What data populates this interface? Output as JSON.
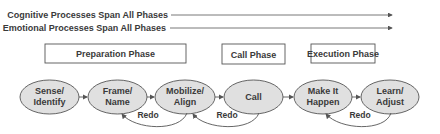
{
  "processes": [
    {
      "label": "Cognitive Processes Span All Phases"
    },
    {
      "label": "Emotional Processes Span All Phases"
    }
  ],
  "phases": [
    {
      "label": "Preparation Phase"
    },
    {
      "label": "Call Phase"
    },
    {
      "label": "Execution Phase"
    }
  ],
  "steps": [
    {
      "line1": "Sense/",
      "line2": "Identify"
    },
    {
      "line1": "Frame/",
      "line2": "Name"
    },
    {
      "line1": "Mobilize/",
      "line2": "Align"
    },
    {
      "line1": "Call",
      "line2": ""
    },
    {
      "line1": "Make It",
      "line2": "Happen"
    },
    {
      "line1": "Learn/",
      "line2": "Adjust"
    }
  ],
  "loops": [
    {
      "label": "Redo"
    },
    {
      "label": "Redo"
    },
    {
      "label": "Redo"
    }
  ],
  "colors": {
    "ellipse_fill": "#e0e0e0",
    "stroke": "#555555",
    "text": "#3a3a3a"
  }
}
